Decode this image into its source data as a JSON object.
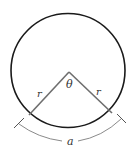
{
  "diagram": {
    "labels": {
      "angle": "θ",
      "radius_left": "r",
      "radius_right": "r",
      "arc": "a"
    },
    "colors": {
      "circle": "#1a1a1a",
      "radius": "#6e6e6e",
      "arc_dimension": "#8a8a8a",
      "text": "#333333"
    }
  }
}
